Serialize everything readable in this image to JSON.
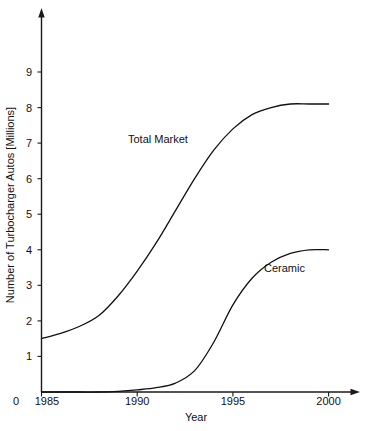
{
  "chart_data": {
    "type": "line",
    "title": "",
    "xlabel": "Year",
    "ylabel": "Number of Turbocharger Autos [Millions]",
    "xlim": [
      1985,
      2001
    ],
    "ylim": [
      0,
      9.6
    ],
    "grid": false,
    "legend_position": "inline-annotation",
    "origin_label": "0",
    "x_ticks": [
      1985,
      1990,
      1995,
      2000
    ],
    "x_tick_labels": [
      "1985",
      "1990",
      "1995",
      "2000"
    ],
    "y_ticks": [
      1,
      2,
      3,
      4,
      5,
      6,
      7,
      8,
      9
    ],
    "y_tick_labels": [
      "1",
      "2",
      "3",
      "4",
      "5",
      "6",
      "7",
      "8",
      "9"
    ],
    "series": [
      {
        "name": "Total Market",
        "label": "Total Market",
        "color": "#111111",
        "x": [
          1985,
          1986,
          1987,
          1988,
          1989,
          1990,
          1991,
          1992,
          1993,
          1994,
          1995,
          1996,
          1997,
          1998,
          1999,
          2000
        ],
        "values": [
          1.5,
          1.65,
          1.85,
          2.15,
          2.7,
          3.4,
          4.2,
          5.1,
          6.0,
          6.8,
          7.4,
          7.8,
          8.0,
          8.1,
          8.1,
          8.1
        ]
      },
      {
        "name": "Ceramic",
        "label": "Ceramic",
        "color": "#111111",
        "x": [
          1985,
          1986,
          1987,
          1988,
          1989,
          1990,
          1991,
          1992,
          1993,
          1994,
          1995,
          1996,
          1997,
          1998,
          1999,
          2000
        ],
        "values": [
          0.0,
          0.0,
          0.0,
          0.0,
          0.02,
          0.06,
          0.12,
          0.25,
          0.6,
          1.4,
          2.45,
          3.2,
          3.65,
          3.9,
          4.0,
          4.0
        ]
      }
    ],
    "annotations": [
      {
        "text": "Total Market",
        "x": 1988.6,
        "y": 6.25,
        "name": "total-market-curve-label"
      },
      {
        "text": "Ceramic",
        "x": 1995.9,
        "y": 3.2,
        "name": "ceramic-curve-label"
      }
    ]
  }
}
